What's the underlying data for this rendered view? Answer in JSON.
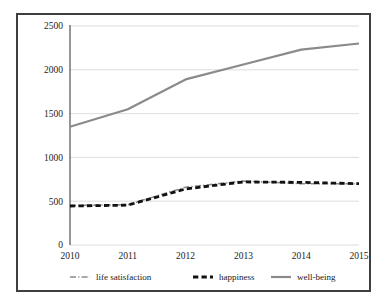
{
  "chart_data": {
    "type": "line",
    "title": "",
    "subtitle": "",
    "xlabel": "",
    "ylabel": "",
    "x": [
      2010,
      2011,
      2012,
      2013,
      2014,
      2015
    ],
    "categories": [
      "2010",
      "2011",
      "2012",
      "2013",
      "2014",
      "2015"
    ],
    "xtick_labels": [
      "2010",
      "2011",
      "2012",
      "2013",
      "2014",
      "2015"
    ],
    "ytick_labels": [
      "0",
      "500",
      "1000",
      "1500",
      "2000",
      "2500"
    ],
    "yticks": [
      0,
      500,
      1000,
      1500,
      2000,
      2500
    ],
    "ylim": [
      0,
      2500
    ],
    "xlim": [
      2010,
      2015
    ],
    "grid": "horizontal",
    "legend_position": "bottom",
    "series": [
      {
        "name": "life satisfaction",
        "label": "life satisfaction",
        "values": [
          450,
          460,
          660,
          730,
          700,
          700
        ],
        "color": "#8c8c8c",
        "style": "dash-dot",
        "width": 1.6
      },
      {
        "name": "happiness",
        "label": "happiness",
        "values": [
          445,
          455,
          640,
          720,
          715,
          700
        ],
        "color": "#111111",
        "style": "dashed",
        "width": 2.8
      },
      {
        "name": "well-being",
        "label": "well-being",
        "values": [
          1350,
          1550,
          1890,
          2060,
          2230,
          2300
        ],
        "color": "#8a8a8a",
        "style": "solid",
        "width": 2.2
      }
    ]
  },
  "legend": {
    "items": [
      {
        "label": "life satisfaction",
        "color": "#8c8c8c",
        "style": "dash-dot"
      },
      {
        "label": "happiness",
        "color": "#111111",
        "style": "dashed"
      },
      {
        "label": "well-being",
        "color": "#8a8a8a",
        "style": "solid"
      }
    ]
  },
  "colors": {
    "frame": "#3f3f3f",
    "gridline": "#d4d4d4",
    "axis": "#404040",
    "background": "#ffffff",
    "text": "#1a1a1a"
  }
}
